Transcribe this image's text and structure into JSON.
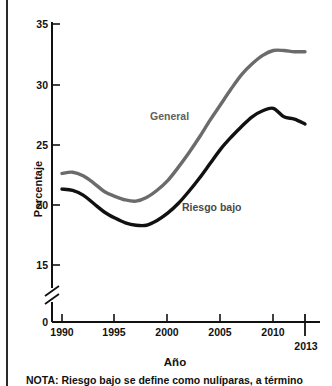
{
  "chart_data": {
    "type": "line",
    "title": "",
    "xlabel": "Año",
    "ylabel": "Porcentaje",
    "xlim": [
      1990,
      2013
    ],
    "ylim": [
      0,
      35
    ],
    "y_axis_break": true,
    "y_break_between": [
      0,
      15
    ],
    "grid": false,
    "legend": "inline-labels",
    "xticks": [
      1990,
      1995,
      2000,
      2005,
      2010,
      2013
    ],
    "xticklabels": [
      "1990",
      "1995",
      "2000",
      "2005",
      "2010",
      "2013"
    ],
    "yticks": [
      0,
      15,
      20,
      25,
      30,
      35
    ],
    "yticklabels": [
      "0",
      "15",
      "20",
      "25",
      "30",
      "35"
    ],
    "x": [
      1990,
      1991,
      1992,
      1993,
      1994,
      1995,
      1996,
      1997,
      1998,
      1999,
      2000,
      2001,
      2002,
      2003,
      2004,
      2005,
      2006,
      2007,
      2008,
      2009,
      2010,
      2011,
      2012,
      2013
    ],
    "series": [
      {
        "name": "General",
        "color": "#6b6b6b",
        "label_x": 2000,
        "label_y": 27.9,
        "values": [
          22.6,
          22.7,
          22.4,
          21.8,
          21.1,
          20.7,
          20.4,
          20.3,
          20.6,
          21.2,
          22.0,
          23.1,
          24.3,
          25.6,
          27.0,
          28.3,
          29.6,
          30.8,
          31.7,
          32.4,
          32.8,
          32.8,
          32.7,
          32.7
        ],
        "label": "General"
      },
      {
        "name": "Riesgo bajo",
        "color": "#111111",
        "label_x": 2002,
        "label_y": 20.1,
        "values": [
          21.3,
          21.2,
          20.8,
          20.1,
          19.4,
          18.9,
          18.5,
          18.3,
          18.3,
          18.7,
          19.3,
          20.1,
          21.1,
          22.2,
          23.4,
          24.6,
          25.6,
          26.5,
          27.3,
          27.8,
          28.0,
          27.3,
          27.1,
          26.7
        ],
        "label": "Riesgo bajo"
      }
    ]
  },
  "axis": {
    "y_title": "Porcentaje",
    "x_title": "Año"
  },
  "note": {
    "text": "NOTA: Riesgo bajo se define como nulíparas, a término"
  }
}
